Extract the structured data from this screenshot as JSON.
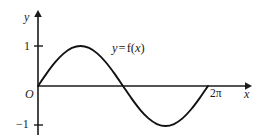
{
  "figure": {
    "background_color": "#ffffff",
    "ink_color": "#1a1a1a",
    "curve_color": "#111111"
  },
  "labels": {
    "y_axis": "y",
    "x_axis": "x",
    "origin": "O",
    "tick_one": "1",
    "tick_neg_one": "−1",
    "tick_twopi": "2π",
    "curve_equation_var_left": "y",
    "curve_equation_equals": "=",
    "curve_equation_fn": "f",
    "curve_equation_paren_open": "(",
    "curve_equation_arg": "x",
    "curve_equation_paren_close": ")",
    "curve_equation_full": "y = f(x)"
  },
  "chart_data": {
    "type": "line",
    "title": "",
    "subtitle": "",
    "xlabel": "x",
    "ylabel": "y",
    "function": "y = sin(x)",
    "grid": false,
    "legend": false,
    "legend_position": "none",
    "annotations": [
      {
        "text": "y = f(x)",
        "x": 2.2,
        "y": 0.78,
        "points_to_curve": true
      }
    ],
    "xlim": [
      -0.35,
      6.9
    ],
    "ylim": [
      -1.45,
      1.5
    ],
    "xtick_values": [
      6.2832
    ],
    "xtick_labels": [
      "2π"
    ],
    "ytick_values": [
      1,
      -1
    ],
    "ytick_labels": [
      "1",
      "−1"
    ],
    "origin_label": "O",
    "x_period_start": 0,
    "x_period_end": 6.2832,
    "amplitude": 1,
    "maximum": {
      "x": 1.5708,
      "y": 1
    },
    "minimum": {
      "x": 4.7124,
      "y": -1
    },
    "zero_crossings": [
      0,
      3.1416,
      6.2832
    ],
    "series": [
      {
        "name": "y = f(x)",
        "x": [
          0,
          0.3142,
          0.6283,
          0.9425,
          1.2566,
          1.5708,
          1.885,
          2.1991,
          2.5133,
          2.8274,
          3.1416,
          3.4558,
          3.7699,
          4.0841,
          4.3982,
          4.7124,
          5.0265,
          5.3407,
          5.6549,
          5.969,
          6.2832
        ],
        "y": [
          0,
          0.309,
          0.5878,
          0.809,
          0.9511,
          1,
          0.9511,
          0.809,
          0.5878,
          0.309,
          0,
          -0.309,
          -0.5878,
          -0.809,
          -0.9511,
          -1,
          -0.9511,
          -0.809,
          -0.5878,
          -0.309,
          0
        ]
      }
    ]
  }
}
